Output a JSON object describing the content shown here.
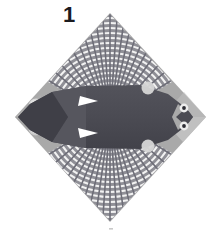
{
  "figure": {
    "label": "1",
    "caption_mark": "·",
    "palette": {
      "page_background": "#ffffff",
      "diamond_fill": "#a9a9a9",
      "diamond_fill_light": "#c6c6c6",
      "body_dark": "#4b4b53",
      "body_mid": "#5a5a62",
      "body_shadow": "#3c3c44",
      "fan_stripe_light": "#efefef",
      "fan_stripe_dark": "#70707a",
      "highlight_white": "#ffffff",
      "circle_light": "#d4d4d4",
      "eye_ring": "#e8e8e8",
      "eye_pupil": "#2c2c33"
    },
    "geometry": {
      "diamond_top": [
        110,
        13
      ],
      "diamond_right": [
        206,
        117
      ],
      "diamond_bottom": [
        110,
        222
      ],
      "diamond_left": [
        15,
        117
      ],
      "body_center": [
        110,
        117
      ],
      "body_left_tip": [
        18,
        117
      ],
      "body_right_tip": [
        193,
        117
      ]
    },
    "parts": [
      {
        "name": "diamond-plate",
        "shape": "rhombus"
      },
      {
        "name": "upper-fan",
        "shape": "radial-striped-fan",
        "stripe_count": 26
      },
      {
        "name": "lower-fan",
        "shape": "radial-striped-fan",
        "stripe_count": 26
      },
      {
        "name": "central-body",
        "shape": "elongated-hexagon"
      },
      {
        "name": "left-marker-circle-upper",
        "shape": "circle"
      },
      {
        "name": "left-marker-circle-lower",
        "shape": "circle"
      },
      {
        "name": "body-circle-upper",
        "shape": "circle"
      },
      {
        "name": "body-circle-lower",
        "shape": "circle"
      },
      {
        "name": "right-eye-upper",
        "shape": "ring"
      },
      {
        "name": "right-eye-lower",
        "shape": "ring"
      },
      {
        "name": "notch-highlight-upper",
        "shape": "triangle"
      },
      {
        "name": "notch-highlight-lower",
        "shape": "triangle"
      }
    ]
  }
}
